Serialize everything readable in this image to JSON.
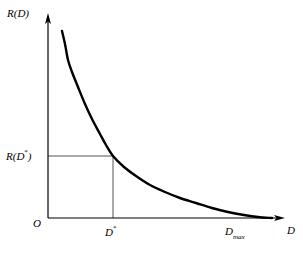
{
  "figure": {
    "background_color": "#ffffff",
    "curve_color": "#000000",
    "guide_color": "#555555",
    "axis_color": "#000000"
  },
  "labels": {
    "y_axis": "R(D)",
    "x_axis": "D",
    "origin": "O",
    "rate_at_dstar_base": "R(D",
    "rate_at_dstar_star": "*",
    "rate_at_dstar_close": ")",
    "dstar_base": "D",
    "dstar_star": "*",
    "dmax_base": "D",
    "dmax_sub": "max"
  },
  "chart_data": {
    "type": "line",
    "title": "",
    "xlabel": "D",
    "ylabel": "R(D)",
    "grid": false,
    "legend": null,
    "xlim": [
      0,
      1
    ],
    "ylim": [
      0,
      1
    ],
    "annotations": [
      {
        "name": "origin",
        "label": "O",
        "x": 0,
        "y": 0
      },
      {
        "name": "dstar",
        "label": "D*",
        "x": 0.33,
        "y": 0
      },
      {
        "name": "dmax",
        "label": "D_max",
        "x": 0.83,
        "y": 0
      },
      {
        "name": "rate_at_dstar",
        "label": "R(D*)",
        "x": 0,
        "y": 0.33
      }
    ],
    "guide_lines": [
      {
        "name": "horizontal-guide",
        "from": [
          0,
          0.33
        ],
        "to": [
          0.33,
          0.33
        ]
      },
      {
        "name": "vertical-guide",
        "from": [
          0.33,
          0.0
        ],
        "to": [
          0.33,
          0.33
        ]
      }
    ],
    "series": [
      {
        "name": "R(D)",
        "x": [
          0.07,
          0.09,
          0.12,
          0.16,
          0.21,
          0.27,
          0.33,
          0.41,
          0.5,
          0.59,
          0.68,
          0.76,
          0.83,
          0.92,
          1.0
        ],
        "y": [
          0.97,
          0.86,
          0.72,
          0.6,
          0.49,
          0.4,
          0.33,
          0.26,
          0.2,
          0.15,
          0.1,
          0.06,
          0.03,
          0.01,
          0.005
        ]
      }
    ],
    "curve_points_px": [
      [
        62,
        31
      ],
      [
        65,
        44
      ],
      [
        68,
        60
      ],
      [
        72,
        72
      ],
      [
        78,
        87
      ],
      [
        85,
        104
      ],
      [
        92,
        119
      ],
      [
        100,
        134
      ],
      [
        106,
        145
      ],
      [
        113,
        156
      ],
      [
        124,
        167
      ],
      [
        136,
        176
      ],
      [
        150,
        185
      ],
      [
        165,
        192
      ],
      [
        180,
        198
      ],
      [
        196,
        203
      ],
      [
        212,
        208
      ],
      [
        228,
        212
      ],
      [
        244,
        215
      ],
      [
        258,
        217
      ],
      [
        272,
        218
      ]
    ]
  }
}
